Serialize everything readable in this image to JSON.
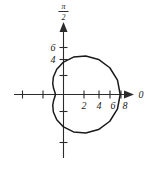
{
  "figure": {
    "title": "",
    "axis_labels": {
      "horizontal_end": "0",
      "vertical_numerator": "π",
      "vertical_denominator": "2"
    }
  },
  "chart_data": {
    "type": "line",
    "plot_system": "polar",
    "title": "",
    "xlabel": "0",
    "ylabel": "π/2",
    "xlim": [
      -3,
      9
    ],
    "ylim": [
      -7,
      7
    ],
    "grid": false,
    "legend": null,
    "x_tick_labels": [
      "2",
      "4",
      "6",
      "8"
    ],
    "x_tick_values": [
      2,
      4,
      6,
      8
    ],
    "x_unlabeled_tick_values": [
      -4,
      -2
    ],
    "y_tick_labels": [
      "6",
      "4"
    ],
    "y_tick_values": [
      6,
      4
    ],
    "y_unlabeled_tick_values": [
      2,
      -2,
      -4
    ],
    "curve_name": "limacon",
    "curve_equation": "r = 4 + 3 cos(theta)",
    "series": [
      {
        "name": "limacon",
        "theta_degrees": [
          0,
          15,
          30,
          45,
          60,
          75,
          90,
          105,
          120,
          135,
          150,
          165,
          180,
          195,
          210,
          225,
          240,
          255,
          270,
          285,
          300,
          315,
          330,
          345,
          360
        ],
        "r_values": [
          7.0,
          6.9,
          6.6,
          6.12,
          5.5,
          4.78,
          4.0,
          3.22,
          2.5,
          1.88,
          1.4,
          1.1,
          1.0,
          1.1,
          1.4,
          1.88,
          2.5,
          3.22,
          4.0,
          4.78,
          5.5,
          6.12,
          6.6,
          6.9,
          7.0
        ]
      }
    ],
    "notable_points": {
      "max_r_at_theta_0": 7,
      "min_r_at_theta_180": 1,
      "r_at_theta_90": 4,
      "r_at_theta_270": 4
    }
  },
  "colors": {
    "curve": "#1a1a1a",
    "axis": "#2b2b2b",
    "background": "#ffffff",
    "text": "#1a1a1a"
  }
}
